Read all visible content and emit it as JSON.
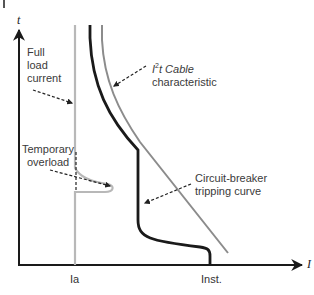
{
  "diagram": {
    "axes": {
      "y_label": "t",
      "x_label": "I"
    },
    "ticks": {
      "ia": "Ia",
      "inst": "Inst."
    },
    "annotations": {
      "full_load_current": [
        "Full",
        "load",
        "current"
      ],
      "cable_characteristic": {
        "i2t_prefix": "I",
        "i2t_superscript": "2",
        "i2t_suffix": "t Cable",
        "line2": "characteristic"
      },
      "temporary_overload": [
        "Temporary",
        "overload"
      ],
      "circuit_breaker": [
        "Circuit-breaker",
        "tripping curve"
      ]
    },
    "colors": {
      "axis": "#1a1a1a",
      "full_load_curve": "#b8b8b8",
      "cable_curve": "#8c8c8c",
      "breaker_curve": "#1a1a1a",
      "leader": "#222222"
    }
  }
}
